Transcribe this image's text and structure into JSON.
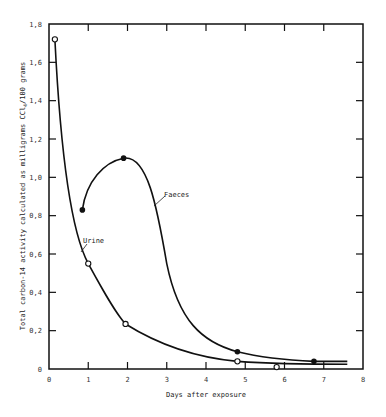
{
  "chart_data": {
    "type": "line",
    "title": "",
    "xlabel": "Days after exposure",
    "ylabel": "Total carbon-14 activity calculated as milligrams CCl4/100 grams",
    "xlim": [
      0,
      8
    ],
    "ylim": [
      0,
      1.8
    ],
    "x_ticks": [
      "0",
      "1",
      "2",
      "3",
      "4",
      "5",
      "6",
      "7",
      "8"
    ],
    "y_ticks": [
      "0",
      "0,2",
      "0,4",
      "0,6",
      "0,8",
      "1,0",
      "1,2",
      "1,4",
      "1,6",
      "1,8"
    ],
    "grid": false,
    "legend": "inline annotations",
    "series": [
      {
        "name": "Urine",
        "marker": "open-circle",
        "x": [
          0.15,
          1.0,
          1.95,
          4.8,
          5.8
        ],
        "y": [
          1.72,
          0.55,
          0.235,
          0.04,
          0.01
        ]
      },
      {
        "name": "Faeces",
        "marker": "filled-circle",
        "x": [
          0.85,
          1.9,
          4.8,
          6.75
        ],
        "y": [
          0.83,
          1.1,
          0.09,
          0.04
        ]
      }
    ],
    "annotations": [
      {
        "text": "Urine",
        "series": "Urine"
      },
      {
        "text": "Faeces",
        "series": "Faeces"
      }
    ]
  },
  "labels": {
    "xlabel": "Days after exposure",
    "ylabel": "Total carbon-14 activity calculated as milligrams CCl",
    "ylabel_sub": "4",
    "ylabel_tail": "/100 grams",
    "urine": "Urine",
    "faeces": "Faeces"
  }
}
